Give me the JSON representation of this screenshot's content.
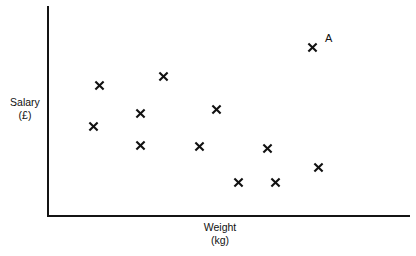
{
  "chart_data": {
    "type": "scatter",
    "title": "",
    "xlabel": "Weight",
    "xlabel_unit": "(kg)",
    "ylabel": "Salary",
    "ylabel_unit": "(£)",
    "grid": false,
    "legend": false,
    "axis_ticks": false,
    "marker": "x",
    "marker_color": "#111111",
    "axis_color": "#141414",
    "background_color": "#ffffff",
    "xlim": [
      0,
      100
    ],
    "ylim": [
      0,
      100
    ],
    "axis_pixel_box": {
      "left": 47,
      "top": 6,
      "right": 410,
      "bottom": 215
    },
    "points": [
      {
        "id": "p1",
        "px": 99,
        "py": 85,
        "x": 14.3,
        "y": 62.2,
        "label": ""
      },
      {
        "id": "p2",
        "px": 93,
        "py": 126,
        "x": 12.7,
        "y": 42.6,
        "label": ""
      },
      {
        "id": "p3",
        "px": 140,
        "py": 113,
        "x": 25.6,
        "y": 48.8,
        "label": ""
      },
      {
        "id": "p4",
        "px": 140,
        "py": 145,
        "x": 25.6,
        "y": 33.5,
        "label": ""
      },
      {
        "id": "p5",
        "px": 163,
        "py": 76,
        "x": 31.9,
        "y": 66.5,
        "label": ""
      },
      {
        "id": "p6",
        "px": 216,
        "py": 109,
        "x": 46.6,
        "y": 50.7,
        "label": ""
      },
      {
        "id": "p7",
        "px": 199,
        "py": 146,
        "x": 41.9,
        "y": 33.0,
        "label": ""
      },
      {
        "id": "p8",
        "px": 238,
        "py": 182,
        "x": 52.6,
        "y": 15.8,
        "label": ""
      },
      {
        "id": "p9",
        "px": 275,
        "py": 182,
        "x": 62.8,
        "y": 15.8,
        "label": ""
      },
      {
        "id": "p10",
        "px": 267,
        "py": 148,
        "x": 60.6,
        "y": 32.1,
        "label": ""
      },
      {
        "id": "p11",
        "px": 318,
        "py": 167,
        "x": 74.7,
        "y": 23.0,
        "label": ""
      },
      {
        "id": "p12",
        "px": 312,
        "py": 47,
        "x": 73.0,
        "y": 80.4,
        "label": "A"
      }
    ],
    "annotations": [
      {
        "text": "A",
        "px": 325,
        "py": 33,
        "refers_to": "p12"
      }
    ]
  }
}
